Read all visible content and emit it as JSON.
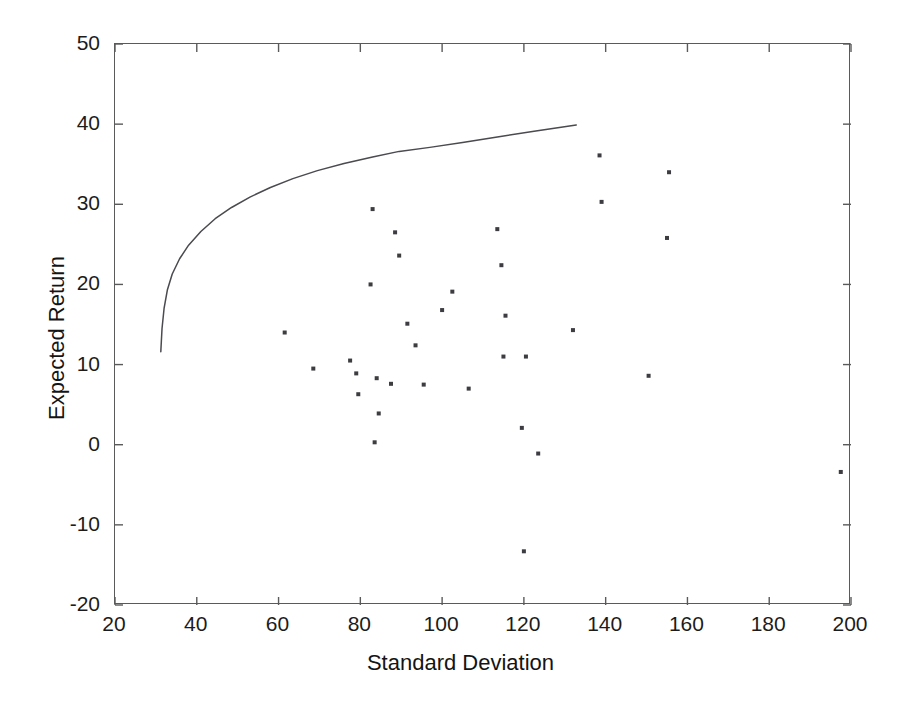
{
  "chart_data": {
    "type": "scatter",
    "title": "",
    "xlabel": "Standard Deviation",
    "ylabel": "Expected Return",
    "xlim": [
      20,
      200
    ],
    "ylim": [
      -20,
      50
    ],
    "xticks": [
      20,
      40,
      60,
      80,
      100,
      120,
      140,
      160,
      180,
      200
    ],
    "yticks": [
      -20,
      -10,
      0,
      10,
      20,
      30,
      40,
      50
    ],
    "xtick_labels": [
      "20",
      "40",
      "60",
      "80",
      "100",
      "120",
      "140",
      "160",
      "180",
      "200"
    ],
    "ytick_labels": [
      "-20",
      "-10",
      "0",
      "10",
      "20",
      "30",
      "40",
      "50"
    ],
    "grid": false,
    "legend": null,
    "series": [
      {
        "name": "Assets",
        "type": "scatter",
        "marker": "square",
        "marker_size": 4,
        "color": "#3c3c41",
        "points": [
          [
            61.5,
            14.0
          ],
          [
            68.5,
            9.5
          ],
          [
            77.5,
            10.5
          ],
          [
            79.0,
            8.9
          ],
          [
            79.5,
            6.3
          ],
          [
            83.0,
            29.4
          ],
          [
            82.5,
            20.0
          ],
          [
            84.0,
            8.3
          ],
          [
            84.5,
            3.9
          ],
          [
            83.5,
            0.3
          ],
          [
            88.5,
            26.5
          ],
          [
            89.5,
            23.6
          ],
          [
            87.5,
            7.6
          ],
          [
            91.5,
            15.1
          ],
          [
            93.5,
            12.4
          ],
          [
            95.5,
            7.5
          ],
          [
            100.0,
            16.8
          ],
          [
            102.5,
            19.1
          ],
          [
            106.5,
            7.0
          ],
          [
            113.5,
            26.9
          ],
          [
            114.5,
            22.4
          ],
          [
            115.5,
            16.1
          ],
          [
            115.0,
            11.0
          ],
          [
            119.5,
            2.1
          ],
          [
            120.5,
            11.0
          ],
          [
            120.0,
            -13.3
          ],
          [
            123.5,
            -1.1
          ],
          [
            132.0,
            14.3
          ],
          [
            138.5,
            36.1
          ],
          [
            139.0,
            30.3
          ],
          [
            150.5,
            8.6
          ],
          [
            155.0,
            25.8
          ],
          [
            155.5,
            34.0
          ],
          [
            197.5,
            -3.4
          ]
        ]
      },
      {
        "name": "Efficient Frontier",
        "type": "line",
        "color": "#4a4a4f",
        "points": [
          [
            31.2,
            11.6
          ],
          [
            31.5,
            14.5
          ],
          [
            32.0,
            17.0
          ],
          [
            32.8,
            19.3
          ],
          [
            34.0,
            21.3
          ],
          [
            35.8,
            23.2
          ],
          [
            38.0,
            24.9
          ],
          [
            41.0,
            26.6
          ],
          [
            44.5,
            28.2
          ],
          [
            48.5,
            29.6
          ],
          [
            53.0,
            30.9
          ],
          [
            58.0,
            32.1
          ],
          [
            63.5,
            33.2
          ],
          [
            69.5,
            34.2
          ],
          [
            76.0,
            35.1
          ],
          [
            83.0,
            35.9
          ],
          [
            89.5,
            36.6
          ],
          [
            97.0,
            37.1
          ],
          [
            105.0,
            37.7
          ],
          [
            113.5,
            38.4
          ],
          [
            122.5,
            39.1
          ],
          [
            132.8,
            39.9
          ]
        ]
      }
    ]
  }
}
